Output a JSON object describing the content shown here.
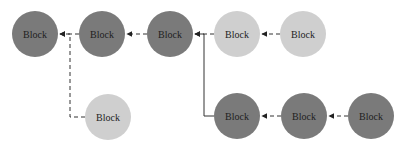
{
  "diagram": {
    "colors": {
      "dark": "#7a7a7a",
      "light": "#cfcfcf",
      "edge": "#333333"
    },
    "nodes": [
      {
        "id": "A",
        "label": "Block",
        "tone": "dark",
        "cx": 35,
        "cy": 34
      },
      {
        "id": "B",
        "label": "Block",
        "tone": "dark",
        "cx": 102,
        "cy": 34
      },
      {
        "id": "C",
        "label": "Block",
        "tone": "dark",
        "cx": 170,
        "cy": 34
      },
      {
        "id": "D",
        "label": "Block",
        "tone": "light",
        "cx": 237,
        "cy": 34
      },
      {
        "id": "E",
        "label": "Block",
        "tone": "light",
        "cx": 303,
        "cy": 34
      },
      {
        "id": "F",
        "label": "Block",
        "tone": "light",
        "cx": 108,
        "cy": 117
      },
      {
        "id": "G",
        "label": "Block",
        "tone": "dark",
        "cx": 237,
        "cy": 116
      },
      {
        "id": "H",
        "label": "Block",
        "tone": "dark",
        "cx": 304,
        "cy": 116
      },
      {
        "id": "I",
        "label": "Block",
        "tone": "dark",
        "cx": 371,
        "cy": 116
      }
    ],
    "edges": [
      {
        "from": "B",
        "to": "A",
        "style": "dashed"
      },
      {
        "from": "C",
        "to": "B",
        "style": "dashed"
      },
      {
        "from": "D",
        "to": "C",
        "style": "dashed"
      },
      {
        "from": "E",
        "to": "D",
        "style": "dashed"
      },
      {
        "from": "F",
        "to": "A",
        "style": "dashed",
        "routing": "elbow"
      },
      {
        "from": "G",
        "to": "C",
        "style": "solid",
        "routing": "elbow"
      },
      {
        "from": "H",
        "to": "G",
        "style": "dashed"
      },
      {
        "from": "I",
        "to": "H",
        "style": "dashed"
      }
    ]
  }
}
